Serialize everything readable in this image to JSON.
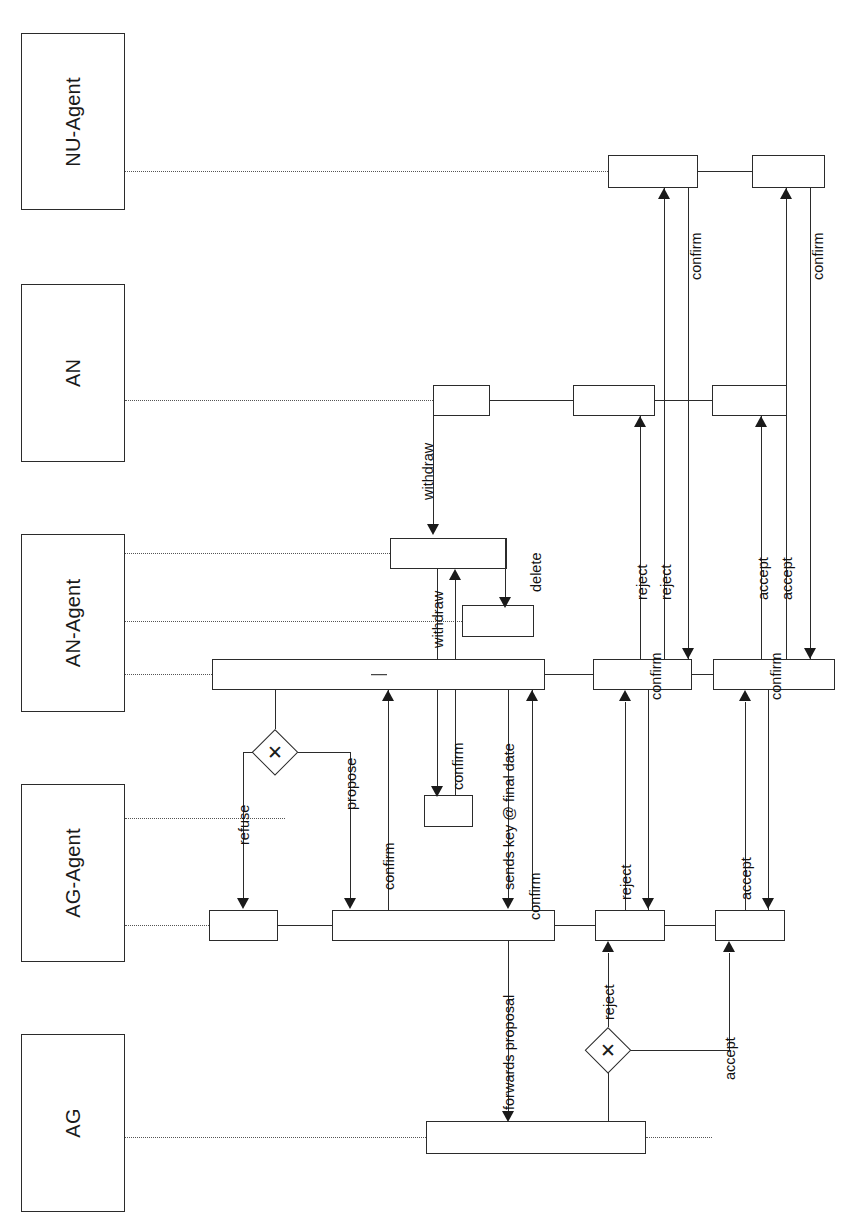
{
  "diagram": {
    "orientation": "rotated-90-ccw",
    "notation": "BPMN collaboration with pools",
    "stroke_color": "#2b2b2b",
    "background_color": "#ffffff",
    "message_flow_style": "dotted"
  },
  "lanes": [
    {
      "id": "nu-agent",
      "label": "NU-Agent"
    },
    {
      "id": "an",
      "label": "AN"
    },
    {
      "id": "an-agent",
      "label": "AN-Agent"
    },
    {
      "id": "ag-agent",
      "label": "AG-Agent"
    },
    {
      "id": "ag",
      "label": "AG"
    }
  ],
  "tasks": [
    {
      "id": "nu-task-1",
      "lane": "nu-agent",
      "label": ""
    },
    {
      "id": "nu-task-2",
      "lane": "nu-agent",
      "label": ""
    },
    {
      "id": "an-task-1",
      "lane": "an",
      "label": ""
    },
    {
      "id": "an-task-2",
      "lane": "an",
      "label": ""
    },
    {
      "id": "an-task-3",
      "lane": "an",
      "label": ""
    },
    {
      "id": "ana-task-top",
      "lane": "an-agent",
      "label": ""
    },
    {
      "id": "ana-task-delete",
      "lane": "an-agent",
      "label": ""
    },
    {
      "id": "ana-task-main",
      "lane": "an-agent",
      "label": "—"
    },
    {
      "id": "ana-task-reject",
      "lane": "an-agent",
      "label": ""
    },
    {
      "id": "ana-task-accept",
      "lane": "an-agent",
      "label": ""
    },
    {
      "id": "aga-task-refuse",
      "lane": "ag-agent",
      "label": ""
    },
    {
      "id": "aga-task-confirm",
      "lane": "ag-agent",
      "label": ""
    },
    {
      "id": "aga-task-main",
      "lane": "ag-agent",
      "label": ""
    },
    {
      "id": "aga-task-reject",
      "lane": "ag-agent",
      "label": ""
    },
    {
      "id": "aga-task-accept",
      "lane": "ag-agent",
      "label": ""
    },
    {
      "id": "ag-task-1",
      "lane": "ag",
      "label": ""
    }
  ],
  "gateways": [
    {
      "id": "gateway-propose-refuse",
      "type": "exclusive",
      "symbol": "✕"
    },
    {
      "id": "gateway-accept-reject",
      "type": "exclusive",
      "symbol": "✕"
    }
  ],
  "edge_labels": {
    "withdraw_an_to_agent": "withdraw",
    "withdraw_agent_internal": "withdraw",
    "delete": "delete",
    "refuse": "refuse",
    "propose": "propose",
    "confirm_propose": "confirm",
    "confirm_final": "confirm",
    "sends_key_final_date": "sends key @ final date",
    "confirm_key": "confirm",
    "forwards_proposal": "forwards proposal",
    "reject_from_gateway": "reject",
    "accept_from_gateway": "accept",
    "reject_aga_to_ana": "reject",
    "reject_ana_to_an": "reject",
    "reject_an_to_nu": "reject",
    "confirm_reject_back": "confirm",
    "confirm_reject_nu": "confirm",
    "accept_aga_to_ana": "accept",
    "accept_ana_to_an": "accept",
    "accept_an_to_nu": "accept",
    "confirm_accept_back": "confirm",
    "confirm_accept_nu": "confirm"
  }
}
